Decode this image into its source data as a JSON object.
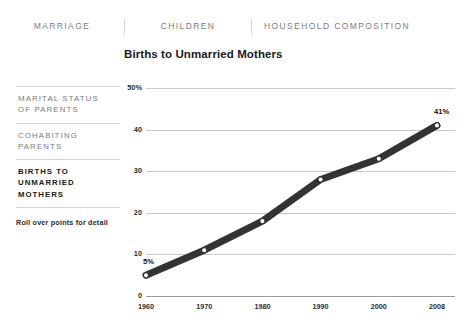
{
  "nav": {
    "tabs": [
      {
        "label": "MARRIAGE"
      },
      {
        "label": "CHILDREN"
      },
      {
        "label": "HOUSEHOLD COMPOSITION"
      }
    ]
  },
  "sidebar": {
    "items": [
      {
        "label": "MARITAL STATUS\nOF PARENTS",
        "active": false
      },
      {
        "label": "COHABITING\nPARENTS",
        "active": false
      },
      {
        "label": "BIRTHS TO\nUNMARRIED\nMOTHERS",
        "active": true
      }
    ],
    "hint": "Roll over points for detail"
  },
  "chart_data": {
    "type": "line",
    "title": "Births to Unmarried Mothers",
    "xlabel": "",
    "ylabel": "",
    "categories": [
      "1960",
      "1970",
      "1980",
      "1990",
      "2000",
      "2008"
    ],
    "values": [
      5,
      11,
      18,
      28,
      33,
      41
    ],
    "ylim": [
      0,
      50
    ],
    "yticks": [
      "0",
      "10",
      "20",
      "30",
      "40",
      "50%"
    ],
    "grid": true,
    "legend": false,
    "point_labels": [
      {
        "category": "1960",
        "text": "5%"
      },
      {
        "category": "2008",
        "text": "41%"
      }
    ],
    "line_color": "#333333",
    "marker_fill": "#ffffff"
  },
  "colors": {
    "line": "#333333",
    "grid": "#c9c9c9",
    "muted_text": "#7a7a7a",
    "dark_text": "#1a1a1a"
  }
}
